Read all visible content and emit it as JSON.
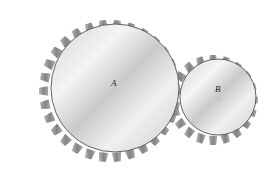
{
  "figure": {
    "type": "meshing-gears",
    "gears": [
      {
        "id": "A",
        "label": "A",
        "cx": 115,
        "cy": 88,
        "r": 64,
        "teeth": 30
      },
      {
        "id": "B",
        "label": "B",
        "cx": 218,
        "cy": 97,
        "r": 38,
        "teeth": 20
      }
    ],
    "colors": {
      "background": "#ffffff",
      "face_light": "#f2f2f2",
      "face_mid": "#cfcfcf",
      "tooth": "#7a7a7a",
      "rim": "#555555"
    }
  }
}
